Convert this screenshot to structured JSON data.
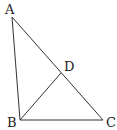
{
  "figure": {
    "type": "geometry-triangle",
    "points": {
      "A": {
        "label": "A",
        "x": 12,
        "y": 17
      },
      "B": {
        "label": "B",
        "x": 20,
        "y": 120
      },
      "C": {
        "label": "C",
        "x": 103,
        "y": 120
      },
      "D": {
        "label": "D",
        "x": 61,
        "y": 73
      }
    },
    "segments": [
      [
        "A",
        "B"
      ],
      [
        "A",
        "C"
      ],
      [
        "B",
        "C"
      ],
      [
        "B",
        "D"
      ]
    ],
    "line_color": "#333333",
    "label_color": "#222222"
  }
}
